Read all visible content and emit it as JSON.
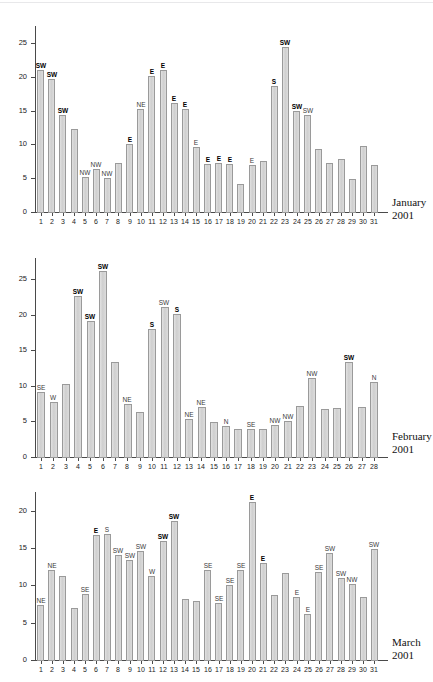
{
  "figure": {
    "type": "multi-panel-bar-chart",
    "background": "#ffffff",
    "bar_fill": "#d4d4d4",
    "bar_stroke": "#9a9a9a",
    "axis_color": "#4a4a4a"
  },
  "chart_data": [
    {
      "type": "bar",
      "title": "January",
      "subtitle": "2001",
      "xlabel": "",
      "ylabel": "",
      "ylim": [
        0,
        27.5
      ],
      "yticks": [
        0,
        5,
        10,
        15,
        20,
        25
      ],
      "grid": false,
      "legend": "none",
      "categories": [
        "1",
        "2",
        "3",
        "4",
        "5",
        "6",
        "7",
        "8",
        "9",
        "10",
        "11",
        "12",
        "13",
        "14",
        "15",
        "16",
        "17",
        "18",
        "19",
        "20",
        "21",
        "22",
        "23",
        "24",
        "25",
        "26",
        "27",
        "28",
        "29",
        "30",
        "31"
      ],
      "values": [
        21.0,
        19.6,
        14.4,
        12.2,
        5.2,
        6.4,
        5.1,
        7.3,
        10.1,
        15.2,
        20.1,
        21.0,
        16.1,
        15.3,
        9.6,
        7.1,
        7.2,
        7.1,
        4.2,
        6.9,
        7.6,
        18.6,
        24.4,
        14.9,
        14.4,
        9.3,
        7.3,
        7.9,
        4.9,
        9.7,
        7.0
      ],
      "annotations": [
        {
          "day": "1",
          "text": "SW",
          "weight": "bold"
        },
        {
          "day": "2",
          "text": "SW",
          "weight": "bold"
        },
        {
          "day": "3",
          "text": "SW",
          "weight": "bold"
        },
        {
          "day": "5",
          "text": "NW",
          "weight": "light"
        },
        {
          "day": "6",
          "text": "NW",
          "weight": "light"
        },
        {
          "day": "7",
          "text": "NW",
          "weight": "light"
        },
        {
          "day": "9",
          "text": "E",
          "weight": "bold"
        },
        {
          "day": "10",
          "text": "NE",
          "weight": "light"
        },
        {
          "day": "11",
          "text": "E",
          "weight": "bold"
        },
        {
          "day": "12",
          "text": "E",
          "weight": "bold"
        },
        {
          "day": "13",
          "text": "E",
          "weight": "bold"
        },
        {
          "day": "14",
          "text": "E",
          "weight": "bold"
        },
        {
          "day": "15",
          "text": "E",
          "weight": "light"
        },
        {
          "day": "16",
          "text": "E",
          "weight": "bold"
        },
        {
          "day": "17",
          "text": "E",
          "weight": "bold"
        },
        {
          "day": "18",
          "text": "E",
          "weight": "bold"
        },
        {
          "day": "20",
          "text": "E",
          "weight": "light"
        },
        {
          "day": "22",
          "text": "S",
          "weight": "bold"
        },
        {
          "day": "23",
          "text": "SW",
          "weight": "bold"
        },
        {
          "day": "24",
          "text": "SW",
          "weight": "bold"
        },
        {
          "day": "25",
          "text": "SW",
          "weight": "light"
        }
      ]
    },
    {
      "type": "bar",
      "title": "February",
      "subtitle": "2001",
      "xlabel": "",
      "ylabel": "",
      "ylim": [
        0,
        28.0
      ],
      "yticks": [
        0,
        5,
        10,
        15,
        20,
        25
      ],
      "grid": false,
      "legend": "none",
      "categories": [
        "1",
        "2",
        "3",
        "4",
        "5",
        "6",
        "7",
        "8",
        "9",
        "10",
        "11",
        "12",
        "13",
        "14",
        "15",
        "16",
        "17",
        "18",
        "19",
        "20",
        "21",
        "22",
        "23",
        "24",
        "25",
        "26",
        "27",
        "28"
      ],
      "values": [
        9.1,
        7.8,
        10.3,
        22.7,
        19.1,
        26.2,
        13.4,
        7.4,
        6.3,
        18.0,
        21.1,
        20.1,
        5.4,
        7.0,
        4.9,
        4.4,
        4.0,
        4.0,
        3.9,
        4.5,
        5.1,
        7.2,
        11.1,
        6.8,
        6.9,
        13.3,
        7.0,
        10.5
      ],
      "annotations": [
        {
          "day": "1",
          "text": "SE",
          "weight": "light"
        },
        {
          "day": "2",
          "text": "W",
          "weight": "light"
        },
        {
          "day": "4",
          "text": "SW",
          "weight": "bold"
        },
        {
          "day": "5",
          "text": "SW",
          "weight": "bold"
        },
        {
          "day": "6",
          "text": "SW",
          "weight": "bold"
        },
        {
          "day": "8",
          "text": "NE",
          "weight": "light"
        },
        {
          "day": "10",
          "text": "S",
          "weight": "bold"
        },
        {
          "day": "11",
          "text": "SW",
          "weight": "light"
        },
        {
          "day": "12",
          "text": "S",
          "weight": "bold"
        },
        {
          "day": "13",
          "text": "NE",
          "weight": "light"
        },
        {
          "day": "14",
          "text": "NE",
          "weight": "light"
        },
        {
          "day": "16",
          "text": "N",
          "weight": "light"
        },
        {
          "day": "18",
          "text": "SE",
          "weight": "light"
        },
        {
          "day": "20",
          "text": "NW",
          "weight": "light"
        },
        {
          "day": "21",
          "text": "NW",
          "weight": "light"
        },
        {
          "day": "23",
          "text": "NW",
          "weight": "light"
        },
        {
          "day": "26",
          "text": "SW",
          "weight": "bold"
        },
        {
          "day": "28",
          "text": "N",
          "weight": "light"
        }
      ]
    },
    {
      "type": "bar",
      "title": "March",
      "subtitle": "2001",
      "xlabel": "",
      "ylabel": "",
      "ylim": [
        0,
        22.5
      ],
      "yticks": [
        0,
        5,
        10,
        15,
        20
      ],
      "grid": false,
      "legend": "none",
      "categories": [
        "1",
        "2",
        "3",
        "4",
        "5",
        "6",
        "7",
        "8",
        "9",
        "10",
        "11",
        "12",
        "13",
        "14",
        "15",
        "16",
        "17",
        "18",
        "19",
        "20",
        "21",
        "22",
        "23",
        "24",
        "25",
        "26",
        "27",
        "28",
        "29",
        "30",
        "31"
      ],
      "values": [
        7.4,
        12.0,
        11.3,
        7.0,
        8.9,
        16.8,
        16.9,
        14.0,
        13.4,
        14.6,
        11.2,
        16.0,
        18.6,
        8.2,
        7.9,
        12.0,
        7.7,
        10.1,
        12.1,
        21.2,
        13.0,
        8.7,
        11.6,
        8.5,
        6.2,
        11.8,
        14.3,
        11.0,
        10.2,
        8.5,
        14.9
      ],
      "annotations": [
        {
          "day": "1",
          "text": "NE",
          "weight": "light"
        },
        {
          "day": "2",
          "text": "NE",
          "weight": "light"
        },
        {
          "day": "5",
          "text": "SE",
          "weight": "light"
        },
        {
          "day": "6",
          "text": "E",
          "weight": "bold"
        },
        {
          "day": "7",
          "text": "S",
          "weight": "light"
        },
        {
          "day": "8",
          "text": "SW",
          "weight": "light"
        },
        {
          "day": "9",
          "text": "SW",
          "weight": "light"
        },
        {
          "day": "10",
          "text": "SW",
          "weight": "light"
        },
        {
          "day": "11",
          "text": "W",
          "weight": "light"
        },
        {
          "day": "12",
          "text": "SW",
          "weight": "bold"
        },
        {
          "day": "13",
          "text": "SW",
          "weight": "bold"
        },
        {
          "day": "16",
          "text": "SE",
          "weight": "light"
        },
        {
          "day": "17",
          "text": "SE",
          "weight": "light"
        },
        {
          "day": "18",
          "text": "SE",
          "weight": "light"
        },
        {
          "day": "19",
          "text": "SE",
          "weight": "light"
        },
        {
          "day": "20",
          "text": "E",
          "weight": "bold"
        },
        {
          "day": "21",
          "text": "E",
          "weight": "bold"
        },
        {
          "day": "24",
          "text": "E",
          "weight": "light"
        },
        {
          "day": "25",
          "text": "E",
          "weight": "light"
        },
        {
          "day": "26",
          "text": "SE",
          "weight": "light"
        },
        {
          "day": "27",
          "text": "SW",
          "weight": "light"
        },
        {
          "day": "28",
          "text": "SW",
          "weight": "light"
        },
        {
          "day": "29",
          "text": "NW",
          "weight": "light"
        },
        {
          "day": "31",
          "text": "SW",
          "weight": "light"
        }
      ]
    }
  ]
}
